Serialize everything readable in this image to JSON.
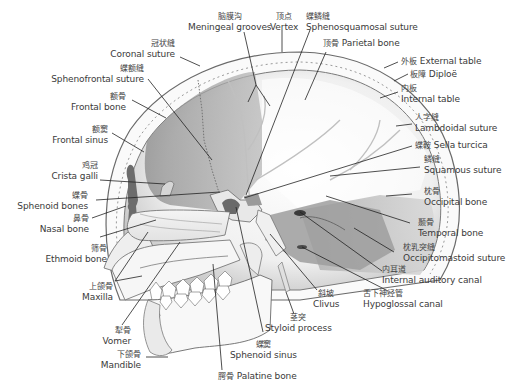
{
  "diagram": {
    "type": "anatomical-cross-section",
    "colors": {
      "background": "#ffffff",
      "bone_outline": "#6a6a6a",
      "bone_dark": "#8c8c8c",
      "bone_mid": "#b4b4b4",
      "bone_light": "#e6e6e6",
      "leader_line": "#222222",
      "text": "#3a3a3a"
    },
    "labels": [
      {
        "id": "meningeal-grooves",
        "zh": "脑膜沟",
        "en": "Meningeal grooves"
      },
      {
        "id": "vertex",
        "zh": "顶点",
        "en": "Vertex"
      },
      {
        "id": "sphenosquamosal-suture",
        "zh": "蝶鳞缝",
        "en": "Sphenosquamosal suture"
      },
      {
        "id": "parietal-bone",
        "zh": "顶骨",
        "en": "Parietal bone"
      },
      {
        "id": "coronal-suture",
        "zh": "冠状缝",
        "en": "Coronal suture"
      },
      {
        "id": "external-table",
        "zh": "外板",
        "en": "External table"
      },
      {
        "id": "sphenofrontal-suture",
        "zh": "蝶额缝",
        "en": "Sphenofrontal suture"
      },
      {
        "id": "diploe",
        "zh": "板障",
        "en": "Diploë"
      },
      {
        "id": "internal-table",
        "zh": "内板",
        "en": "Internal table"
      },
      {
        "id": "frontal-bone",
        "zh": "额骨",
        "en": "Frontal bone"
      },
      {
        "id": "lambdoidal-suture",
        "zh": "人字缝",
        "en": "Lambdoidal suture"
      },
      {
        "id": "frontal-sinus",
        "zh": "额窦",
        "en": "Frontal sinus"
      },
      {
        "id": "sella-turcica",
        "zh": "蝶鞍",
        "en": "Sella turcica"
      },
      {
        "id": "squamous-suture",
        "zh": "鳞缝",
        "en": "Squamous suture"
      },
      {
        "id": "crista-galli",
        "zh": "鸡冠",
        "en": "Crista galli"
      },
      {
        "id": "sphenoid-bones",
        "zh": "蝶骨",
        "en": "Sphenoid bones"
      },
      {
        "id": "occipital-bone",
        "zh": "枕骨",
        "en": "Occipital bone"
      },
      {
        "id": "nasal-bone",
        "zh": "鼻骨",
        "en": "Nasal bone"
      },
      {
        "id": "temporal-bone",
        "zh": "颞骨",
        "en": "Temporal bone"
      },
      {
        "id": "ethmoid-bone",
        "zh": "筛骨",
        "en": "Ethmoid bone"
      },
      {
        "id": "occipitomastoid-suture",
        "zh": "枕乳突缝",
        "en": "Occipitomastoid suture"
      },
      {
        "id": "internal-auditory-canal",
        "zh": "内耳道",
        "en": "Internal auditory canal"
      },
      {
        "id": "maxilla",
        "zh": "上颌骨",
        "en": "Maxilla"
      },
      {
        "id": "hypoglossal-canal",
        "zh": "舌下神经管",
        "en": "Hypoglossal canal"
      },
      {
        "id": "clivus",
        "zh": "斜坡",
        "en": "Clivus"
      },
      {
        "id": "styloid-process",
        "zh": "茎突",
        "en": "Styloid process"
      },
      {
        "id": "vomer",
        "zh": "犁骨",
        "en": "Vomer"
      },
      {
        "id": "sphenoid-sinus",
        "zh": "蝶窦",
        "en": "Sphenoid sinus"
      },
      {
        "id": "mandible",
        "zh": "下颌骨",
        "en": "Mandible"
      },
      {
        "id": "palatine-bone",
        "zh": "腭骨",
        "en": "Palatine bone"
      }
    ]
  }
}
